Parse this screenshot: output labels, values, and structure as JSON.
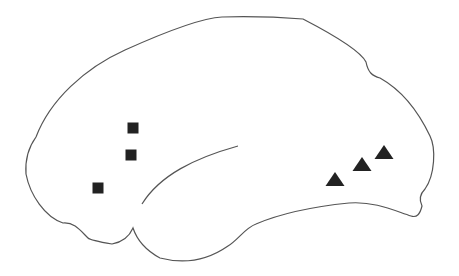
{
  "diagram": {
    "type": "brain-lateral-view",
    "outline_color": "#555555",
    "marker_color": "#222222",
    "background": "#ffffff"
  },
  "markers": {
    "squares": [
      {
        "x": 133,
        "y": 128,
        "size": 11
      },
      {
        "x": 131,
        "y": 155,
        "size": 11
      },
      {
        "x": 98,
        "y": 188,
        "size": 11
      }
    ],
    "triangles": [
      {
        "x": 335,
        "y": 179,
        "width": 19,
        "height": 14
      },
      {
        "x": 362,
        "y": 164,
        "width": 19,
        "height": 14
      },
      {
        "x": 384,
        "y": 152,
        "width": 19,
        "height": 14
      }
    ]
  }
}
